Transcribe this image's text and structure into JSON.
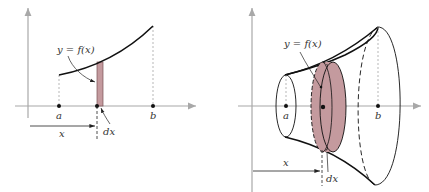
{
  "colors": {
    "axis": "#a8a8a8",
    "curve": "#111111",
    "fill": "#c49a9e",
    "fill_stroke": "#7a5054",
    "guide": "#9a9a9a",
    "text": "#333333"
  },
  "left_figure": {
    "curve_label": "y = f(x)",
    "point_a": "a",
    "point_b": "b",
    "distance_label": "x",
    "width_label": "dx"
  },
  "right_figure": {
    "curve_label": "y = f(x)",
    "point_a": "a",
    "point_b": "b",
    "distance_label": "x",
    "width_label": "dx"
  }
}
